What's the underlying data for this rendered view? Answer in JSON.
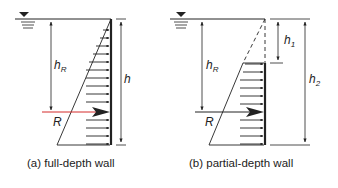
{
  "colors": {
    "line": "#222222",
    "resultant": "#d42a2a",
    "background": "#ffffff"
  },
  "panels": [
    {
      "id": "a",
      "caption": "(a) full-depth wall",
      "labels": {
        "hR_base": "h",
        "hR_sub": "R",
        "h": "h",
        "R": "R"
      }
    },
    {
      "id": "b",
      "caption": "(b) partial-depth wall",
      "labels": {
        "hR_base": "h",
        "hR_sub": "R",
        "h1_base": "h",
        "h1_sub": "1",
        "h2_base": "h",
        "h2_sub": "2",
        "R": "R"
      }
    }
  ],
  "icons": {
    "water_surface": "inverted-triangle-water-level-symbol"
  }
}
